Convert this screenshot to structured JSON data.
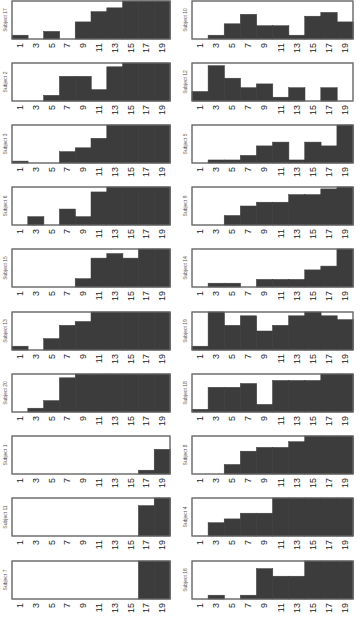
{
  "chart_data": {
    "type": "bar",
    "layout": "small-multiples, 2 columns x 10 rows, step histograms",
    "xlabel": "",
    "ylabel": "",
    "x_ticks": [
      "1",
      "3",
      "5",
      "7",
      "9",
      "11",
      "13",
      "15",
      "17",
      "19"
    ],
    "categories": [
      "1",
      "3",
      "5",
      "7",
      "9",
      "11",
      "13",
      "15",
      "17",
      "19"
    ],
    "ylim": [
      0,
      1
    ],
    "grid": false,
    "legend": "none",
    "bar_color": "#3c3c3c",
    "panels": [
      {
        "column": "left",
        "label": "Subject 17",
        "values": [
          0.1,
          0,
          0.2,
          0,
          0.45,
          0.72,
          0.82,
          1,
          1,
          1
        ]
      },
      {
        "column": "left",
        "label": "Subject 2",
        "values": [
          0,
          0,
          0.15,
          0.65,
          0.65,
          0.3,
          0.9,
          1,
          1,
          1
        ]
      },
      {
        "column": "left",
        "label": "Subject 3",
        "values": [
          0.05,
          0,
          0,
          0.3,
          0.4,
          0.65,
          1,
          1,
          1,
          1
        ]
      },
      {
        "column": "left",
        "label": "Subject 6",
        "values": [
          0,
          0.22,
          0,
          0.42,
          0.22,
          0.87,
          1,
          1,
          1,
          1
        ]
      },
      {
        "column": "left",
        "label": "Subject 15",
        "values": [
          0,
          0,
          0,
          0,
          0.22,
          0.76,
          0.88,
          0.76,
          1,
          1
        ]
      },
      {
        "column": "left",
        "label": "Subject 13",
        "values": [
          0.1,
          0,
          0.3,
          0.65,
          0.75,
          1,
          1,
          1,
          1,
          1
        ]
      },
      {
        "column": "left",
        "label": "Subject 20",
        "values": [
          0,
          0.1,
          0.3,
          0.9,
          1,
          1,
          1,
          1,
          1,
          1
        ]
      },
      {
        "column": "left",
        "label": "Subject 1",
        "values": [
          0,
          0,
          0,
          0,
          0,
          0,
          0,
          0,
          0.1,
          0.65
        ]
      },
      {
        "column": "left",
        "label": "Subject 11",
        "values": [
          0,
          0,
          0,
          0,
          0,
          0,
          0,
          0,
          0.8,
          1
        ]
      },
      {
        "column": "left",
        "label": "Subject 7",
        "values": [
          0,
          0,
          0,
          0,
          0,
          0,
          0,
          0,
          1,
          1
        ]
      },
      {
        "column": "right",
        "label": "Subject 10",
        "values": [
          0,
          0.1,
          0.4,
          0.65,
          0.35,
          0.35,
          0.1,
          0.6,
          0.7,
          0.45
        ]
      },
      {
        "column": "right",
        "label": "Subject 12",
        "values": [
          0.25,
          0.93,
          0.6,
          0.35,
          0.45,
          0.1,
          0.35,
          0,
          0.35,
          0
        ]
      },
      {
        "column": "right",
        "label": "Subject 5",
        "values": [
          0,
          0.08,
          0.08,
          0.2,
          0.45,
          0.55,
          0.08,
          0.55,
          0.45,
          1
        ]
      },
      {
        "column": "right",
        "label": "Subject 9",
        "values": [
          0,
          0,
          0.25,
          0.5,
          0.6,
          0.6,
          0.8,
          0.8,
          0.95,
          1
        ]
      },
      {
        "column": "right",
        "label": "Subject 14",
        "values": [
          0,
          0.1,
          0.1,
          0,
          0.2,
          0.2,
          0.2,
          0.45,
          0.55,
          1
        ]
      },
      {
        "column": "right",
        "label": "Subject 19",
        "values": [
          0.1,
          1,
          0.65,
          0.9,
          0.5,
          0.65,
          0.9,
          1,
          0.9,
          0.8
        ]
      },
      {
        "column": "right",
        "label": "Subject 18",
        "values": [
          0.07,
          0.65,
          0.65,
          0.75,
          0.2,
          0.83,
          0.83,
          0.83,
          1,
          1
        ]
      },
      {
        "column": "right",
        "label": "Subject 8",
        "values": [
          0,
          0,
          0.25,
          0.6,
          0.7,
          0.7,
          0.85,
          1,
          1,
          1
        ]
      },
      {
        "column": "right",
        "label": "Subject 4",
        "values": [
          0,
          0.35,
          0.45,
          0.6,
          0.6,
          1,
          1,
          1,
          1,
          1
        ]
      },
      {
        "column": "right",
        "label": "Subject 16",
        "values": [
          0,
          0.1,
          0,
          0.1,
          0.8,
          0.6,
          0.6,
          1,
          1,
          1
        ]
      }
    ]
  }
}
